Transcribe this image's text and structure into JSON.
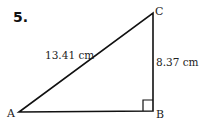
{
  "problem_number": "5.",
  "vertices": {
    "A": {
      "label": "A",
      "x": 19,
      "y": 112
    },
    "B": {
      "label": "B",
      "x": 153,
      "y": 111
    },
    "C": {
      "label": "C",
      "x": 153,
      "y": 13
    }
  },
  "measurements": {
    "hypotenuse_AC": "13.41 cm",
    "side_BC": "8.37 cm"
  },
  "right_angle_at": "B",
  "colors": {
    "stroke": "#111111",
    "background": "#ffffff"
  }
}
